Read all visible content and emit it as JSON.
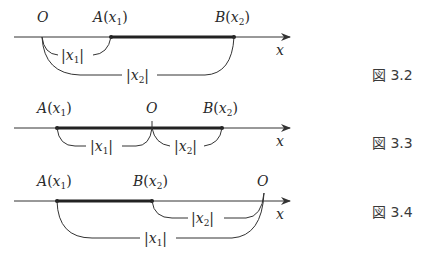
{
  "figures": [
    {
      "caption": "図 3.2",
      "axis_label": "x",
      "points": {
        "O": "O",
        "A": {
          "name": "A",
          "arg": "x",
          "sub": "1"
        },
        "B": {
          "name": "B",
          "arg": "x",
          "sub": "2"
        }
      },
      "distances": [
        {
          "label": "x",
          "sub": "1",
          "between": "O-A"
        },
        {
          "label": "x",
          "sub": "2",
          "between": "O-B"
        }
      ]
    },
    {
      "caption": "図 3.3",
      "axis_label": "x",
      "points": {
        "O": "O",
        "A": {
          "name": "A",
          "arg": "x",
          "sub": "1"
        },
        "B": {
          "name": "B",
          "arg": "x",
          "sub": "2"
        }
      },
      "distances": [
        {
          "label": "x",
          "sub": "1",
          "between": "A-O"
        },
        {
          "label": "x",
          "sub": "2",
          "between": "O-B"
        }
      ]
    },
    {
      "caption": "図 3.4",
      "axis_label": "x",
      "points": {
        "O": "O",
        "A": {
          "name": "A",
          "arg": "x",
          "sub": "1"
        },
        "B": {
          "name": "B",
          "arg": "x",
          "sub": "2"
        }
      },
      "distances": [
        {
          "label": "x",
          "sub": "2",
          "between": "B-O"
        },
        {
          "label": "x",
          "sub": "1",
          "between": "A-O"
        }
      ]
    }
  ],
  "colors": {
    "line": "#333333",
    "segment": "#222222",
    "text": "#2a2a2a"
  }
}
